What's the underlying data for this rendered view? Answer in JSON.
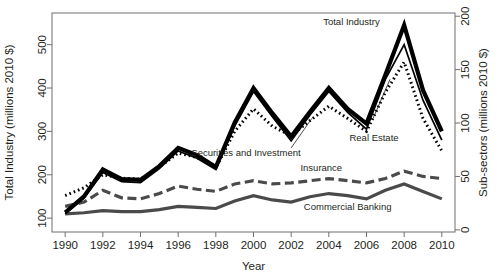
{
  "chart_data": {
    "type": "line",
    "title": "",
    "xlabel": "Year",
    "ylabel": "Total Industry (millions 2010 $)",
    "y2label": "Sub-sectors (millions 2010 $)",
    "x": [
      1990,
      1991,
      1992,
      1993,
      1994,
      1995,
      1996,
      1997,
      1998,
      1999,
      2000,
      2001,
      2002,
      2003,
      2004,
      2005,
      2006,
      2007,
      2008,
      2009,
      2010
    ],
    "xtick_labels": [
      "1990",
      "1992",
      "1994",
      "1996",
      "1998",
      "2000",
      "2002",
      "2004",
      "2006",
      "2008",
      "2010"
    ],
    "xticks": [
      1990,
      1992,
      1994,
      1996,
      1998,
      2000,
      2002,
      2004,
      2006,
      2008,
      2010
    ],
    "xlim": [
      1989.3,
      2010.7
    ],
    "yticks": [
      100,
      200,
      300,
      400,
      500
    ],
    "ytick_labels": [
      "100",
      "200",
      "300",
      "400",
      "500"
    ],
    "ylim": [
      68,
      573
    ],
    "y2ticks": [
      0,
      50,
      100,
      150,
      200
    ],
    "y2tick_labels": [
      "0",
      "50",
      "100",
      "150",
      "200"
    ],
    "y2lim": [
      -2,
      203
    ],
    "grid": false,
    "legend_position": "inline-annotations",
    "series": [
      {
        "name": "Total Industry",
        "axis": "left",
        "style": "solid-thick",
        "color": "#000000",
        "label_x": 2005.2,
        "label_y": 552,
        "values": [
          113,
          150,
          212,
          190,
          188,
          220,
          262,
          245,
          218,
          320,
          400,
          342,
          288,
          345,
          400,
          352,
          318,
          430,
          545,
          395,
          300
        ]
      },
      {
        "name": "Real Estate",
        "axis": "left",
        "style": "solid-thin",
        "color": "#000000",
        "label_x": 2006.4,
        "label_y": 283,
        "values": [
          110,
          146,
          205,
          184,
          182,
          214,
          255,
          238,
          212,
          312,
          392,
          334,
          278,
          338,
          392,
          344,
          305,
          420,
          500,
          372,
          280
        ]
      },
      {
        "name": "Securities and Investment",
        "axis": "left",
        "style": "dotted",
        "color": "#000000",
        "label_x": 1999.6,
        "label_y": 250,
        "values": [
          152,
          170,
          200,
          192,
          190,
          218,
          250,
          240,
          216,
          300,
          352,
          312,
          290,
          325,
          358,
          330,
          300,
          390,
          460,
          330,
          255
        ]
      },
      {
        "name": "Insurance",
        "axis": "right",
        "style": "dashed",
        "color": "#4a4a4a",
        "label_x": 2003.6,
        "label_y": 57,
        "values": [
          22,
          26,
          37,
          30,
          29,
          34,
          41,
          38,
          36,
          43,
          46,
          43,
          44,
          46,
          48,
          46,
          44,
          48,
          55,
          50,
          48
        ]
      },
      {
        "name": "Commercial Banking",
        "axis": "right",
        "style": "solid-medium",
        "color": "#4a4a4a",
        "label_x": 2005.0,
        "label_y": 21,
        "values": [
          15,
          16,
          18,
          17,
          17,
          19,
          22,
          21,
          20,
          27,
          32,
          28,
          26,
          31,
          34,
          32,
          29,
          37,
          43,
          36,
          29
        ]
      }
    ]
  }
}
